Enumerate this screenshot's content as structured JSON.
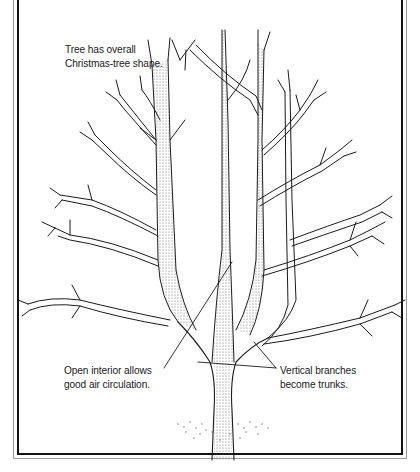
{
  "figure": {
    "colors": {
      "ink": "#1a1a1a",
      "background": "#ffffff",
      "frame_outer": "#9a9a9a",
      "frame_inner": "#111111",
      "stipple": "#6a6a6a"
    }
  },
  "labels": {
    "shape": {
      "line1": "Tree has overall",
      "line2": "Christmas-tree shape."
    },
    "interior": {
      "line1": "Open interior allows",
      "line2": "good air circulation."
    },
    "vertical": {
      "line1": "Vertical branches",
      "line2": "become trunks."
    }
  }
}
